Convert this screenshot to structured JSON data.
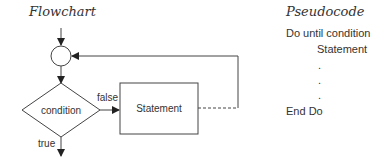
{
  "flowchart": {
    "title": "Flowchart",
    "decision_label": "condition",
    "false_label": "false",
    "true_label": "true",
    "process_label": "Statement",
    "colors": {
      "stroke": "#444444",
      "text": "#333333"
    }
  },
  "pseudocode": {
    "title": "Pseudocode",
    "lines": [
      {
        "text": "Do until condition"
      },
      {
        "text": "Statement"
      },
      {
        "text": "."
      },
      {
        "text": "."
      },
      {
        "text": "."
      },
      {
        "text": "End Do"
      }
    ]
  }
}
